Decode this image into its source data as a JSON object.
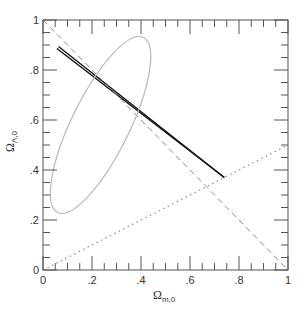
{
  "chart_data": {
    "type": "line",
    "title": "",
    "xlabel": "Ω_{m,0}",
    "ylabel": "Ω_{Λ,0}",
    "xlim": [
      0,
      1
    ],
    "ylim": [
      0,
      1
    ],
    "grid": false,
    "legend": null,
    "x_ticks": [
      0,
      0.2,
      0.4,
      0.6,
      0.8,
      1
    ],
    "x_tick_labels": [
      "0",
      ".2",
      ".4",
      ".6",
      ".8",
      "1"
    ],
    "y_ticks": [
      0,
      0.2,
      0.4,
      0.6,
      0.8,
      1
    ],
    "y_tick_labels": [
      "0",
      ".2",
      ".4",
      ".6",
      ".8",
      "1"
    ],
    "series": [
      {
        "name": "thick-constraint-band",
        "style": "solid-double-black",
        "x": [
          0.06,
          0.74
        ],
        "y": [
          0.89,
          0.37
        ]
      },
      {
        "name": "flat-universe-line",
        "style": "dashed-gray",
        "x": [
          0.0,
          1.0
        ],
        "y": [
          1.0,
          0.0
        ]
      },
      {
        "name": "deceleration-line",
        "style": "dotted-gray",
        "x": [
          0.0,
          1.0
        ],
        "y": [
          0.0,
          0.5
        ]
      },
      {
        "name": "confidence-ellipse",
        "style": "solid-light-gray",
        "shape": "ellipse",
        "center": [
          0.235,
          0.58
        ],
        "top_point": [
          0.41,
          0.93
        ],
        "bottom_point": [
          0.06,
          0.23
        ]
      }
    ]
  },
  "labels": {
    "x_axis_main": "Ω",
    "x_axis_sub": "m,0",
    "y_axis_main": "Ω",
    "y_axis_sub": "Λ,0"
  }
}
